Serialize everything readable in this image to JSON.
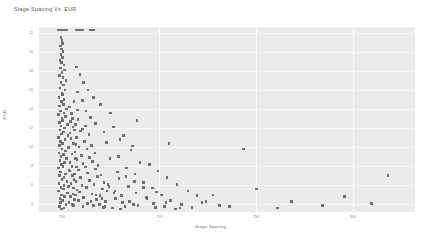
{
  "chart_data": {
    "type": "scatter",
    "title": "Stage Spacing Vs. EUR",
    "xlabel": "Stage Spacing",
    "ylabel": "EUR",
    "xlim": [
      138,
      332
    ],
    "ylim": [
      3.2,
      22.6
    ],
    "grid": true,
    "legend": null,
    "xticks": [
      150,
      200,
      250,
      300
    ],
    "xtick_labels": [
      "150",
      "200",
      "250",
      "300"
    ],
    "yticks": [
      4,
      6,
      8,
      10,
      12,
      14,
      16,
      18,
      20,
      22
    ],
    "ytick_labels": [
      "4",
      "6",
      "8",
      "10",
      "12",
      "14",
      "16",
      "18",
      "20",
      "22"
    ],
    "marker": "square",
    "marker_color": "#6e6e6e",
    "plot_background": "#ebebeb",
    "points": [
      [
        148.2,
        22.3
      ],
      [
        149.0,
        22.3
      ],
      [
        149.8,
        22.3
      ],
      [
        150.6,
        22.3
      ],
      [
        151.4,
        22.3
      ],
      [
        152.2,
        22.3
      ],
      [
        157.0,
        22.3
      ],
      [
        157.9,
        22.3
      ],
      [
        158.8,
        22.3
      ],
      [
        159.7,
        22.3
      ],
      [
        160.6,
        22.3
      ],
      [
        164.5,
        22.3
      ],
      [
        165.4,
        22.3
      ],
      [
        166.3,
        22.3
      ],
      [
        149.4,
        21.5
      ],
      [
        149.9,
        21.2
      ],
      [
        150.2,
        20.9
      ],
      [
        149.1,
        20.6
      ],
      [
        149.7,
        20.3
      ],
      [
        150.4,
        20.0
      ],
      [
        149.3,
        19.7
      ],
      [
        150.0,
        19.4
      ],
      [
        148.8,
        19.1
      ],
      [
        149.6,
        18.9
      ],
      [
        150.8,
        18.6
      ],
      [
        149.2,
        18.3
      ],
      [
        151.2,
        18.1
      ],
      [
        149.9,
        17.8
      ],
      [
        148.6,
        17.5
      ],
      [
        150.3,
        17.3
      ],
      [
        152.0,
        17.0
      ],
      [
        149.4,
        16.8
      ],
      [
        150.7,
        16.5
      ],
      [
        148.9,
        16.2
      ],
      [
        151.5,
        16.0
      ],
      [
        149.8,
        15.7
      ],
      [
        150.1,
        15.5
      ],
      [
        148.4,
        15.2
      ],
      [
        151.0,
        15.0
      ],
      [
        149.5,
        14.8
      ],
      [
        150.5,
        14.5
      ],
      [
        148.7,
        14.3
      ],
      [
        152.3,
        14.0
      ],
      [
        149.1,
        13.8
      ],
      [
        150.9,
        13.6
      ],
      [
        148.2,
        13.4
      ],
      [
        151.7,
        13.2
      ],
      [
        149.9,
        13.0
      ],
      [
        150.2,
        12.8
      ],
      [
        148.5,
        12.6
      ],
      [
        152.6,
        12.4
      ],
      [
        149.3,
        12.2
      ],
      [
        151.1,
        12.0
      ],
      [
        148.8,
        11.8
      ],
      [
        150.6,
        11.6
      ],
      [
        149.7,
        11.4
      ],
      [
        152.9,
        11.2
      ],
      [
        148.1,
        11.0
      ],
      [
        151.4,
        10.8
      ],
      [
        149.2,
        10.6
      ],
      [
        150.0,
        10.4
      ],
      [
        148.6,
        10.2
      ],
      [
        153.2,
        10.0
      ],
      [
        149.9,
        9.8
      ],
      [
        151.8,
        9.6
      ],
      [
        148.3,
        9.4
      ],
      [
        150.7,
        9.2
      ],
      [
        149.4,
        9.0
      ],
      [
        152.1,
        8.8
      ],
      [
        148.9,
        8.6
      ],
      [
        151.2,
        8.4
      ],
      [
        149.6,
        8.2
      ],
      [
        150.3,
        8.0
      ],
      [
        148.0,
        7.8
      ],
      [
        153.5,
        7.6
      ],
      [
        149.1,
        7.4
      ],
      [
        151.6,
        7.2
      ],
      [
        148.7,
        7.0
      ],
      [
        150.9,
        6.8
      ],
      [
        149.8,
        6.6
      ],
      [
        152.4,
        6.4
      ],
      [
        148.4,
        6.2
      ],
      [
        151.0,
        6.0
      ],
      [
        149.3,
        5.8
      ],
      [
        150.5,
        5.6
      ],
      [
        148.2,
        5.4
      ],
      [
        152.8,
        5.2
      ],
      [
        149.7,
        5.0
      ],
      [
        151.3,
        4.8
      ],
      [
        148.8,
        4.6
      ],
      [
        150.1,
        4.4
      ],
      [
        149.0,
        4.2
      ],
      [
        152.0,
        4.0
      ],
      [
        148.5,
        3.8
      ],
      [
        150.8,
        3.6
      ],
      [
        149.5,
        3.5
      ],
      [
        155.4,
        13.0
      ],
      [
        156.8,
        12.4
      ],
      [
        158.1,
        12.9
      ],
      [
        159.5,
        11.7
      ],
      [
        157.2,
        11.0
      ],
      [
        160.3,
        11.9
      ],
      [
        162.0,
        12.2
      ],
      [
        155.9,
        10.4
      ],
      [
        158.7,
        10.0
      ],
      [
        161.4,
        10.6
      ],
      [
        163.8,
        11.3
      ],
      [
        156.5,
        9.5
      ],
      [
        159.9,
        9.1
      ],
      [
        162.7,
        9.8
      ],
      [
        165.1,
        10.2
      ],
      [
        157.6,
        8.7
      ],
      [
        160.8,
        8.3
      ],
      [
        164.2,
        8.9
      ],
      [
        166.9,
        9.4
      ],
      [
        155.1,
        8.0
      ],
      [
        158.3,
        7.6
      ],
      [
        161.9,
        7.9
      ],
      [
        165.7,
        8.5
      ],
      [
        168.4,
        8.1
      ],
      [
        156.2,
        7.2
      ],
      [
        159.4,
        6.8
      ],
      [
        163.1,
        7.3
      ],
      [
        167.2,
        7.7
      ],
      [
        170.0,
        7.1
      ],
      [
        157.0,
        6.4
      ],
      [
        160.2,
        6.0
      ],
      [
        164.0,
        6.5
      ],
      [
        168.1,
        6.9
      ],
      [
        171.6,
        6.3
      ],
      [
        155.8,
        5.7
      ],
      [
        159.0,
        5.3
      ],
      [
        162.5,
        5.8
      ],
      [
        166.4,
        6.1
      ],
      [
        170.9,
        5.6
      ],
      [
        174.2,
        5.9
      ],
      [
        156.9,
        5.0
      ],
      [
        161.1,
        4.7
      ],
      [
        165.3,
        5.1
      ],
      [
        169.5,
        4.9
      ],
      [
        173.0,
        5.4
      ],
      [
        176.8,
        5.2
      ],
      [
        158.5,
        4.4
      ],
      [
        162.9,
        4.1
      ],
      [
        167.8,
        4.5
      ],
      [
        172.4,
        4.3
      ],
      [
        177.5,
        4.6
      ],
      [
        181.0,
        4.2
      ],
      [
        155.3,
        4.0
      ],
      [
        160.7,
        3.8
      ],
      [
        166.0,
        3.9
      ],
      [
        171.2,
        3.7
      ],
      [
        176.1,
        3.6
      ],
      [
        182.3,
        3.8
      ],
      [
        186.9,
        4.0
      ],
      [
        153.6,
        14.2
      ],
      [
        154.8,
        13.5
      ],
      [
        156.1,
        14.8
      ],
      [
        157.8,
        13.9
      ],
      [
        154.2,
        12.7
      ],
      [
        155.6,
        12.1
      ],
      [
        153.9,
        11.5
      ],
      [
        156.4,
        11.8
      ],
      [
        154.5,
        10.9
      ],
      [
        157.1,
        10.3
      ],
      [
        153.3,
        9.9
      ],
      [
        155.0,
        9.3
      ],
      [
        156.7,
        8.8
      ],
      [
        154.0,
        8.4
      ],
      [
        157.4,
        7.9
      ],
      [
        153.7,
        7.5
      ],
      [
        155.2,
        7.0
      ],
      [
        156.0,
        6.6
      ],
      [
        154.6,
        6.2
      ],
      [
        153.1,
        5.9
      ],
      [
        157.7,
        5.5
      ],
      [
        155.5,
        5.1
      ],
      [
        154.3,
        4.8
      ],
      [
        156.3,
        4.5
      ],
      [
        153.4,
        4.2
      ],
      [
        155.8,
        3.9
      ],
      [
        176.3,
        12.1
      ],
      [
        181.7,
        11.2
      ],
      [
        172.8,
        10.5
      ],
      [
        185.4,
        9.7
      ],
      [
        178.9,
        9.0
      ],
      [
        190.2,
        8.4
      ],
      [
        174.6,
        8.8
      ],
      [
        183.1,
        7.8
      ],
      [
        195.0,
        8.2
      ],
      [
        187.6,
        7.2
      ],
      [
        179.3,
        6.7
      ],
      [
        199.4,
        7.5
      ],
      [
        191.8,
        6.3
      ],
      [
        184.2,
        5.9
      ],
      [
        204.1,
        6.8
      ],
      [
        196.5,
        5.7
      ],
      [
        188.0,
        5.2
      ],
      [
        209.3,
        6.1
      ],
      [
        201.2,
        5.0
      ],
      [
        193.4,
        4.7
      ],
      [
        214.8,
        5.4
      ],
      [
        206.0,
        4.4
      ],
      [
        197.1,
        4.1
      ],
      [
        219.6,
        4.9
      ],
      [
        211.5,
        4.0
      ],
      [
        202.8,
        3.8
      ],
      [
        224.2,
        4.3
      ],
      [
        216.9,
        3.7
      ],
      [
        231.0,
        3.9
      ],
      [
        208.4,
        3.5
      ],
      [
        173.5,
        6.1
      ],
      [
        177.2,
        5.4
      ],
      [
        180.6,
        4.9
      ],
      [
        184.8,
        4.3
      ],
      [
        189.1,
        3.9
      ],
      [
        193.7,
        4.6
      ],
      [
        198.2,
        3.7
      ],
      [
        203.5,
        4.2
      ],
      [
        178.4,
        7.4
      ],
      [
        182.9,
        6.9
      ],
      [
        187.3,
        6.4
      ],
      [
        192.0,
        5.8
      ],
      [
        167.5,
        5.0
      ],
      [
        170.4,
        4.6
      ],
      [
        164.9,
        4.3
      ],
      [
        169.1,
        4.0
      ],
      [
        172.0,
        3.8
      ],
      [
        175.8,
        3.6
      ],
      [
        180.2,
        3.5
      ],
      [
        205.0,
        10.4
      ],
      [
        243.5,
        9.8
      ],
      [
        318.0,
        7.0
      ],
      [
        250.2,
        5.6
      ],
      [
        227.8,
        5.0
      ],
      [
        268.4,
        4.3
      ],
      [
        198.6,
        5.3
      ],
      [
        222.0,
        4.2
      ],
      [
        295.6,
        4.8
      ],
      [
        210.8,
        3.6
      ],
      [
        236.2,
        3.8
      ],
      [
        261.0,
        3.6
      ],
      [
        284.3,
        3.9
      ],
      [
        309.7,
        4.1
      ],
      [
        188.5,
        12.8
      ],
      [
        174.9,
        13.6
      ],
      [
        169.8,
        14.5
      ],
      [
        166.1,
        15.2
      ],
      [
        163.2,
        16.0
      ],
      [
        161.0,
        16.8
      ],
      [
        159.2,
        17.6
      ],
      [
        157.5,
        18.4
      ],
      [
        158.0,
        15.8
      ],
      [
        160.5,
        14.9
      ],
      [
        162.3,
        13.8
      ],
      [
        164.7,
        13.1
      ],
      [
        167.0,
        12.5
      ],
      [
        171.5,
        11.6
      ],
      [
        179.8,
        10.8
      ],
      [
        186.1,
        10.1
      ]
    ]
  }
}
